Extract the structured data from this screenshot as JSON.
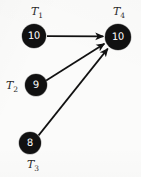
{
  "diagram": {
    "type": "directed-graph",
    "background_color": "#fbfbfa",
    "node_color": "#111111",
    "node_text_color": "#ffffff",
    "edge_color": "#111111",
    "nodes": [
      {
        "id": "T1",
        "label_text": "T",
        "label_sub": "1",
        "value": "10",
        "cx": 34,
        "cy": 36,
        "r": 12,
        "label_x": 37,
        "label_y": 13
      },
      {
        "id": "T2",
        "label_text": "T",
        "label_sub": "2",
        "value": "9",
        "cx": 36,
        "cy": 85,
        "r": 11,
        "label_x": 14,
        "label_y": 88
      },
      {
        "id": "T3",
        "label_text": "T",
        "label_sub": "3",
        "value": "8",
        "cx": 30,
        "cy": 143,
        "r": 11,
        "label_x": 33,
        "label_y": 167
      },
      {
        "id": "T4",
        "label_text": "T",
        "label_sub": "4",
        "value": "10",
        "cx": 118,
        "cy": 37,
        "r": 13,
        "label_x": 119,
        "label_y": 13
      }
    ],
    "edges": [
      {
        "id": "edge-t1-t4",
        "from": "T1",
        "to": "T4",
        "arrowhead": "true"
      },
      {
        "id": "edge-t2-t4",
        "from": "T2",
        "to": "T4",
        "arrowhead": "true"
      },
      {
        "id": "edge-t3-t4",
        "from": "T3",
        "to": "T4",
        "arrowhead": "true"
      }
    ]
  }
}
